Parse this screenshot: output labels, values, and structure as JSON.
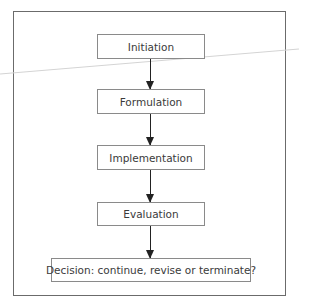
{
  "diagram": {
    "type": "flowchart",
    "direction": "top-to-bottom",
    "nodes": [
      {
        "id": "initiation",
        "label": "Initiation"
      },
      {
        "id": "formulation",
        "label": "Formulation"
      },
      {
        "id": "implementation",
        "label": "Implementation"
      },
      {
        "id": "evaluation",
        "label": "Evaluation"
      },
      {
        "id": "decision",
        "label": "Decision: continue, revise or terminate?"
      }
    ],
    "edges": [
      {
        "from": "initiation",
        "to": "formulation"
      },
      {
        "from": "formulation",
        "to": "implementation"
      },
      {
        "from": "implementation",
        "to": "evaluation"
      },
      {
        "from": "evaluation",
        "to": "decision"
      }
    ]
  },
  "colors": {
    "frame_border": "#6b6b6b",
    "box_border": "#8a8a8a",
    "text": "#3a3a3a",
    "arrow": "#222222"
  }
}
